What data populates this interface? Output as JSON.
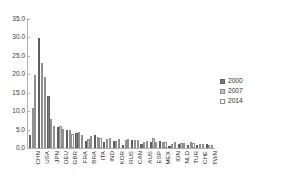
{
  "chart_data": {
    "type": "bar",
    "title": "",
    "subtitle": "",
    "xlabel": "",
    "ylabel": "",
    "ylim": [
      0,
      35
    ],
    "ytick_step": 5,
    "ytick_labels": [
      "0.0",
      "5.0",
      "10.0",
      "15.0",
      "20.0",
      "25.0",
      "30.0",
      "35.0"
    ],
    "grid": false,
    "legend_position": "right",
    "categories": [
      "CHN",
      "USA",
      "JPN",
      "DEU",
      "GBR",
      "FRA",
      "BRA",
      "ITA",
      "IND",
      "KOR",
      "RUS",
      "CAN",
      "AUS",
      "ESP",
      "MEX",
      "IDN",
      "NLD",
      "TUR",
      "CHE",
      "TWN"
    ],
    "series": [
      {
        "name": "2000",
        "color": "#7d7d7d",
        "values": [
          3.6,
          29.8,
          14.0,
          5.6,
          4.8,
          4.1,
          2.0,
          3.4,
          1.5,
          1.8,
          0.8,
          2.2,
          1.2,
          1.7,
          1.9,
          0.6,
          1.2,
          0.8,
          0.8,
          1.0
        ]
      },
      {
        "name": "2007",
        "color": "#c4c4c4",
        "values": [
          10.8,
          23.2,
          7.8,
          6.0,
          5.0,
          4.4,
          2.4,
          3.0,
          2.4,
          2.0,
          2.2,
          2.2,
          1.7,
          2.6,
          1.6,
          1.0,
          1.4,
          1.5,
          1.0,
          0.9
        ]
      },
      {
        "name": "2014",
        "color": "#ffffff",
        "values": [
          19.8,
          19.4,
          6.0,
          5.1,
          3.9,
          3.6,
          3.2,
          2.6,
          2.6,
          2.4,
          2.4,
          2.2,
          1.9,
          1.7,
          1.7,
          1.5,
          1.3,
          1.3,
          1.0,
          0.9
        ]
      }
    ]
  },
  "legend": {
    "items": [
      {
        "label": "2000"
      },
      {
        "label": "2007"
      },
      {
        "label": "2014"
      }
    ]
  }
}
